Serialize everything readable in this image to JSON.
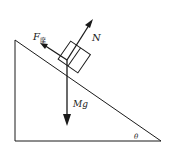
{
  "diagram": {
    "type": "free-body-diagram",
    "labels": {
      "friction": "F",
      "friction_subscript": "摩",
      "normal": "N",
      "gravity": "Mg",
      "angle": "θ"
    },
    "colors": {
      "line": "#1a1a1a",
      "background": "#ffffff"
    }
  }
}
